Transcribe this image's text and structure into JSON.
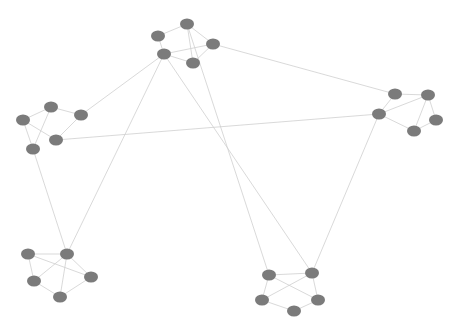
{
  "graph": {
    "style": {
      "node_color": "#7b7b7b",
      "edge_color": "#cfcfcf",
      "node_rx": 7,
      "node_ry": 5.5
    },
    "nodes": [
      {
        "id": "t0",
        "cluster": "top",
        "x": 187,
        "y": 24
      },
      {
        "id": "t1",
        "cluster": "top",
        "x": 158,
        "y": 36
      },
      {
        "id": "t2",
        "cluster": "top",
        "x": 213,
        "y": 44
      },
      {
        "id": "t3",
        "cluster": "top",
        "x": 164,
        "y": 54
      },
      {
        "id": "t4",
        "cluster": "top",
        "x": 193,
        "y": 63
      },
      {
        "id": "l0",
        "cluster": "left",
        "x": 51,
        "y": 107
      },
      {
        "id": "l1",
        "cluster": "left",
        "x": 81,
        "y": 115
      },
      {
        "id": "l2",
        "cluster": "left",
        "x": 23,
        "y": 120
      },
      {
        "id": "l3",
        "cluster": "left",
        "x": 56,
        "y": 140
      },
      {
        "id": "l4",
        "cluster": "left",
        "x": 33,
        "y": 149
      },
      {
        "id": "r0",
        "cluster": "right",
        "x": 395,
        "y": 94
      },
      {
        "id": "r1",
        "cluster": "right",
        "x": 428,
        "y": 95
      },
      {
        "id": "r2",
        "cluster": "right",
        "x": 379,
        "y": 114
      },
      {
        "id": "r3",
        "cluster": "right",
        "x": 436,
        "y": 120
      },
      {
        "id": "r4",
        "cluster": "right",
        "x": 414,
        "y": 131
      },
      {
        "id": "bl0",
        "cluster": "bottom-left",
        "x": 28,
        "y": 254
      },
      {
        "id": "bl1",
        "cluster": "bottom-left",
        "x": 67,
        "y": 254
      },
      {
        "id": "bl2",
        "cluster": "bottom-left",
        "x": 91,
        "y": 277
      },
      {
        "id": "bl3",
        "cluster": "bottom-left",
        "x": 34,
        "y": 281
      },
      {
        "id": "bl4",
        "cluster": "bottom-left",
        "x": 60,
        "y": 297
      },
      {
        "id": "br0",
        "cluster": "bottom-right",
        "x": 269,
        "y": 275
      },
      {
        "id": "br1",
        "cluster": "bottom-right",
        "x": 312,
        "y": 273
      },
      {
        "id": "br2",
        "cluster": "bottom-right",
        "x": 262,
        "y": 300
      },
      {
        "id": "br3",
        "cluster": "bottom-right",
        "x": 318,
        "y": 300
      },
      {
        "id": "br4",
        "cluster": "bottom-right",
        "x": 294,
        "y": 311
      }
    ],
    "edges": [
      [
        "t0",
        "t1"
      ],
      [
        "t0",
        "t2"
      ],
      [
        "t1",
        "t3"
      ],
      [
        "t3",
        "t2"
      ],
      [
        "t3",
        "t4"
      ],
      [
        "t4",
        "t2"
      ],
      [
        "t0",
        "t4"
      ],
      [
        "l0",
        "l1"
      ],
      [
        "l0",
        "l2"
      ],
      [
        "l0",
        "l4"
      ],
      [
        "l2",
        "l3"
      ],
      [
        "l2",
        "l4"
      ],
      [
        "l1",
        "l3"
      ],
      [
        "r0",
        "r1"
      ],
      [
        "r0",
        "r2"
      ],
      [
        "r1",
        "r2"
      ],
      [
        "r1",
        "r3"
      ],
      [
        "r1",
        "r4"
      ],
      [
        "r2",
        "r4"
      ],
      [
        "r3",
        "r4"
      ],
      [
        "bl0",
        "bl1"
      ],
      [
        "bl0",
        "bl3"
      ],
      [
        "bl0",
        "bl2"
      ],
      [
        "bl1",
        "bl2"
      ],
      [
        "bl1",
        "bl4"
      ],
      [
        "bl3",
        "bl4"
      ],
      [
        "bl4",
        "bl2"
      ],
      [
        "bl1",
        "bl3"
      ],
      [
        "br0",
        "br1"
      ],
      [
        "br0",
        "br2"
      ],
      [
        "br0",
        "br3"
      ],
      [
        "br1",
        "br2"
      ],
      [
        "br1",
        "br3"
      ],
      [
        "br2",
        "br4"
      ],
      [
        "br3",
        "br4"
      ],
      [
        "t3",
        "l1"
      ],
      [
        "t3",
        "bl1"
      ],
      [
        "t3",
        "br1"
      ],
      [
        "t0",
        "br0"
      ],
      [
        "t2",
        "r0"
      ],
      [
        "l3",
        "r2"
      ],
      [
        "l4",
        "bl1"
      ],
      [
        "r2",
        "br1"
      ]
    ]
  }
}
